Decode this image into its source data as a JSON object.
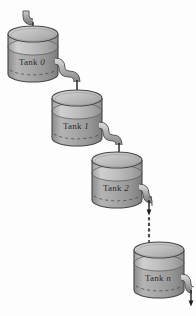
{
  "diagram": {
    "type": "tank-cascade-schematic",
    "background_color": "#fdfdfd",
    "tank_fill_top_color": "#b9b9b9",
    "tank_fill_bottom_color": "#9a9a9a",
    "tank_outline_color": "#4a4a4a",
    "pipe_color": "#a8a8a8",
    "pipe_outline_color": "#4a4a4a",
    "label_color": "#1b1b1b",
    "ellipsis_label": "vertical-dotted-continuation"
  },
  "tanks": [
    {
      "id": "tank-0",
      "label_prefix": "Tank",
      "label_index": "0",
      "x": 8,
      "y": 26,
      "width": 50,
      "height": 48,
      "ellipse_ry": 8,
      "fluid_level_offset": 13
    },
    {
      "id": "tank-1",
      "label_prefix": "Tank",
      "label_index": "1",
      "x": 52,
      "y": 90,
      "width": 50,
      "height": 48,
      "ellipse_ry": 8,
      "fluid_level_offset": 13
    },
    {
      "id": "tank-2",
      "label_prefix": "Tank",
      "label_index": "2",
      "x": 92,
      "y": 152,
      "width": 50,
      "height": 48,
      "ellipse_ry": 8,
      "fluid_level_offset": 13
    },
    {
      "id": "tank-n",
      "label_prefix": "Tank",
      "label_index": "n",
      "x": 134,
      "y": 242,
      "width": 50,
      "height": 48,
      "ellipse_ry": 8,
      "fluid_level_offset": 13
    }
  ],
  "pipes": [
    {
      "id": "inlet-pipe-top",
      "from": "source",
      "to": "tank-0",
      "kind": "elbow-down"
    },
    {
      "id": "pipe-tank0-to-tank1",
      "from": "tank-0",
      "to": "tank-1",
      "kind": "elbow-down"
    },
    {
      "id": "pipe-tank1-to-tank2",
      "from": "tank-1",
      "to": "tank-2",
      "kind": "elbow-down"
    },
    {
      "id": "pipe-tank2-to-dots",
      "from": "tank-2",
      "to": "ellipsis",
      "kind": "elbow-down"
    },
    {
      "id": "outlet-pipe-bottom",
      "from": "tank-n",
      "to": "drain",
      "kind": "elbow-down"
    }
  ]
}
